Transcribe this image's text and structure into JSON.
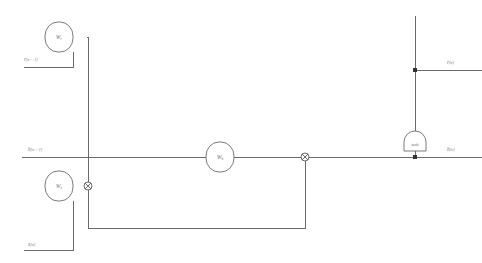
{
  "diagram": {
    "type": "block-diagram",
    "background_color": "#ffffff",
    "wire_color": "#6b6b6b",
    "label_color": "#707070",
    "nodes": [
      {
        "id": "weight-r",
        "kind": "rounded-square-node",
        "symbol": "W",
        "subscript": "r",
        "x": 59,
        "y": 37,
        "width": 28,
        "height": 30
      },
      {
        "id": "weight-x",
        "kind": "rounded-square-node",
        "symbol": "W",
        "subscript": "x",
        "x": 59,
        "y": 186,
        "width": 28,
        "height": 30
      },
      {
        "id": "weight-h",
        "kind": "rounded-square-node",
        "symbol": "W",
        "subscript": "h",
        "x": 220,
        "y": 157,
        "width": 28,
        "height": 30
      },
      {
        "id": "activation-tanh",
        "kind": "dome-block",
        "symbol": "tanh",
        "x": 415,
        "y": 133,
        "width": 22,
        "height": 18
      }
    ],
    "junctions": [
      {
        "id": "sum-input",
        "kind": "cross-circle",
        "x": 88,
        "y": 186,
        "radius": 4
      },
      {
        "id": "sum-recurrent",
        "kind": "cross-circle",
        "x": 305,
        "y": 157,
        "radius": 4
      },
      {
        "id": "tap-r-out",
        "kind": "solid-dot",
        "x": 415,
        "y": 70,
        "radius": 2
      },
      {
        "id": "tap-h-out",
        "kind": "solid-dot",
        "x": 415,
        "y": 157,
        "radius": 2
      }
    ],
    "signals": [
      {
        "id": "input-r-prev",
        "symbol": "r",
        "index": "[n − 1]",
        "text": "r[n − 1]",
        "x": 24,
        "y": 61,
        "role": "input"
      },
      {
        "id": "input-h-prev",
        "symbol": "h",
        "index": "[n − 1]",
        "text": "h[n − 1]",
        "x": 28,
        "y": 151,
        "role": "input"
      },
      {
        "id": "input-x",
        "symbol": "x",
        "index": "[n]",
        "text": "x[n]",
        "x": 28,
        "y": 246,
        "role": "input"
      },
      {
        "id": "output-r",
        "symbol": "r",
        "index": "[n]",
        "text": "r[n]",
        "x": 447,
        "y": 64,
        "role": "output"
      },
      {
        "id": "output-h",
        "symbol": "h",
        "index": "[n]",
        "text": "h[n]",
        "x": 447,
        "y": 151,
        "role": "output"
      }
    ],
    "wire_paths": [
      {
        "id": "wire-r-prev-in",
        "d": "M 24 67 L 73 67 L 73 52"
      },
      {
        "id": "wire-r-node-out",
        "d": "M 87 37 L 88 37 L 88 186"
      },
      {
        "id": "wire-h-prev-main",
        "d": "M 22 157 L 482 157"
      },
      {
        "id": "wire-x-in",
        "d": "M 24 250 L 73 250 L 73 201"
      },
      {
        "id": "wire-x-node-out",
        "d": "M 87 186 L 84 186"
      },
      {
        "id": "wire-feedback",
        "d": "M 305 161 L 305 228 L 88 228 L 88 190"
      },
      {
        "id": "wire-tanh-up",
        "d": "M 415 16 L 415 133"
      },
      {
        "id": "wire-tanh-down",
        "d": "M 415 151 L 415 157"
      },
      {
        "id": "wire-r-out",
        "d": "M 415 70 L 482 70"
      }
    ]
  }
}
